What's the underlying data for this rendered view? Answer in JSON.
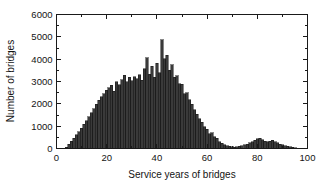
{
  "chart_data": {
    "type": "bar",
    "title": "",
    "subtitle": "",
    "xlabel": "Service years of bridges",
    "ylabel": "Number of bridges",
    "xlim": [
      0,
      100
    ],
    "ylim": [
      0,
      6000
    ],
    "grid": false,
    "legend": null,
    "legend_position": "none",
    "bar_color": "#3a3a3a",
    "bar_edge_color": "#111111",
    "axis_color": "#1a1a1a",
    "background_color": "#ffffff",
    "xticks": [
      0,
      20,
      40,
      60,
      80,
      100
    ],
    "xtick_labels": [
      "0",
      "20",
      "40",
      "60",
      "80",
      "100"
    ],
    "xticks_minor": [
      10,
      30,
      50,
      70,
      90
    ],
    "yticks": [
      0,
      1000,
      2000,
      3000,
      4000,
      5000,
      6000
    ],
    "ytick_labels": [
      "0",
      "1000",
      "2000",
      "3000",
      "4000",
      "5000",
      "6000"
    ],
    "yticks_minor": [
      500,
      1500,
      2500,
      3500,
      4500,
      5500
    ],
    "bin_width": 1,
    "categories": [
      4,
      5,
      6,
      7,
      8,
      9,
      10,
      11,
      12,
      13,
      14,
      15,
      16,
      17,
      18,
      19,
      20,
      21,
      22,
      23,
      24,
      25,
      26,
      27,
      28,
      29,
      30,
      31,
      32,
      33,
      34,
      35,
      36,
      37,
      38,
      39,
      40,
      41,
      42,
      43,
      44,
      45,
      46,
      47,
      48,
      49,
      50,
      51,
      52,
      53,
      54,
      55,
      56,
      57,
      58,
      59,
      60,
      61,
      62,
      63,
      64,
      65,
      66,
      67,
      68,
      69,
      70,
      71,
      72,
      73,
      74,
      75,
      76,
      77,
      78,
      79,
      80,
      81,
      82,
      83,
      84,
      85,
      86,
      87,
      88,
      89,
      90,
      91,
      92,
      93,
      94,
      95
    ],
    "values": [
      60,
      180,
      330,
      470,
      620,
      760,
      900,
      1080,
      1240,
      1420,
      1600,
      1790,
      1980,
      2150,
      2320,
      2460,
      2600,
      2720,
      2840,
      2560,
      2980,
      2860,
      3080,
      3280,
      2980,
      3180,
      3040,
      3220,
      3120,
      3300,
      3060,
      3560,
      4060,
      3320,
      3680,
      3180,
      3820,
      3400,
      4860,
      4020,
      4180,
      3500,
      3760,
      3200,
      3260,
      2900,
      2880,
      2460,
      2500,
      2180,
      1980,
      1740,
      1540,
      1340,
      1180,
      980,
      860,
      660,
      700,
      520,
      460,
      300,
      240,
      160,
      120,
      90,
      70,
      60,
      70,
      90,
      120,
      160,
      200,
      250,
      300,
      360,
      430,
      450,
      390,
      330,
      300,
      320,
      360,
      300,
      250,
      200,
      160,
      130,
      100,
      80,
      60,
      40
    ]
  },
  "figure": {
    "width": 328,
    "height": 183
  }
}
